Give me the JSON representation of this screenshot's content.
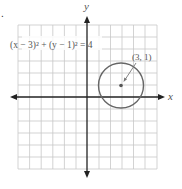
{
  "figure": {
    "marker": ".",
    "equation": "(x − 3)² + (y − 1)² = 4",
    "center_label": "(3, 1)",
    "x_axis_label": "x",
    "y_axis_label": "y"
  },
  "graph": {
    "grid": {
      "x_min": -6,
      "x_max": 6,
      "y_min": -6,
      "y_max": 6,
      "step": 1
    },
    "circle": {
      "center": [
        3,
        1
      ],
      "radius": 2
    },
    "colors": {
      "grid": "#c8c8c8",
      "axis": "#222222",
      "circle": "#666666",
      "text": "#666666"
    }
  }
}
